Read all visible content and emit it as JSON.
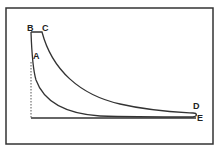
{
  "diagram": {
    "type": "pressure-volume indicator diagram",
    "frame": true,
    "points": {
      "A": "A",
      "B": "B",
      "C": "C",
      "D": "D",
      "E": "E"
    },
    "colors": {
      "line": "#333333",
      "background": "#ffffff"
    }
  }
}
